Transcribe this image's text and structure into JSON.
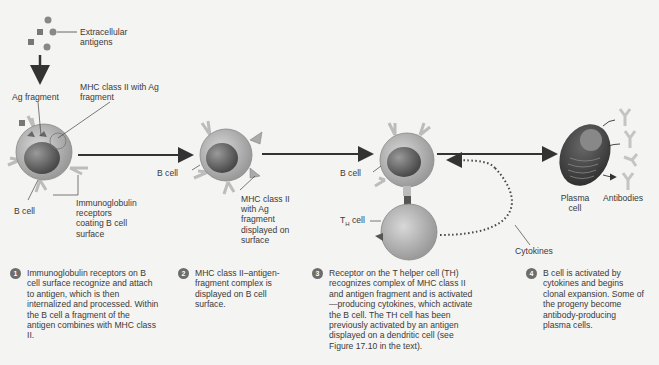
{
  "diagram": {
    "labels": {
      "extracellular_antigens": "Extracellular antigens",
      "ag_fragment": "Ag fragment",
      "mhc_with_fragment": "MHC class II with Ag fragment",
      "b_cell_1": "B cell",
      "ig_receptors": "Immunoglobulin receptors coating B cell surface",
      "b_cell_2": "B cell",
      "mhc_displayed": "MHC class II with Ag fragment displayed on surface",
      "b_cell_3": "B cell",
      "th_cell": "TH cell",
      "cytokines": "Cytokines",
      "plasma_cell": "Plasma cell",
      "antibodies": "Antibodies"
    },
    "steps": [
      {
        "number": "1",
        "text": "Immunoglobulin receptors on B cell surface recognize and attach to antigen, which is then internalized and processed. Within the B cell a fragment of the antigen combines with MHC class II."
      },
      {
        "number": "2",
        "text": "MHC class II–antigen-fragment complex is displayed on B cell surface."
      },
      {
        "number": "3",
        "text": "Receptor on the T helper cell (TH) recognizes complex of MHC class II and antigen fragment and is activated—producing cytokines, which activate the B cell. The TH cell has been previously activated by an antigen displayed on a dendritic cell (see Figure 17.10 in the text)."
      },
      {
        "number": "4",
        "text": "B cell is activated by cytokines and begins clonal expansion. Some of the progeny become antibody-producing plasma cells."
      }
    ]
  }
}
